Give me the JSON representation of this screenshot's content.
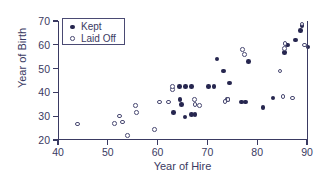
{
  "chart_data": {
    "type": "scatter",
    "title": "",
    "xlabel": "Year of Hire",
    "ylabel": "Year of Birth",
    "xlim": [
      40,
      90
    ],
    "ylim": [
      20,
      70
    ],
    "xticks": [
      40,
      50,
      60,
      70,
      80,
      90
    ],
    "yticks": [
      20,
      30,
      40,
      50,
      60,
      70
    ],
    "grid": false,
    "legend_position": "top-left",
    "series": [
      {
        "name": "Kept",
        "marker": "filled-circle",
        "color": "#26264f",
        "points": [
          [
            63.0,
            31.5
          ],
          [
            64.3,
            37.0
          ],
          [
            64.6,
            34.8
          ],
          [
            64.2,
            42.6
          ],
          [
            65.4,
            42.6
          ],
          [
            66.6,
            42.6
          ],
          [
            65.3,
            29.7
          ],
          [
            66.6,
            30.6
          ],
          [
            67.3,
            30.8
          ],
          [
            70.0,
            42.6
          ],
          [
            71.1,
            42.6
          ],
          [
            71.7,
            54.0
          ],
          [
            73.0,
            49.0
          ],
          [
            74.2,
            44.0
          ],
          [
            73.8,
            36.9
          ],
          [
            76.6,
            36.0
          ],
          [
            77.4,
            36.0
          ],
          [
            78.0,
            53.0
          ],
          [
            81.0,
            33.7
          ],
          [
            83.0,
            37.7
          ],
          [
            85.3,
            56.8
          ],
          [
            85.9,
            60.0
          ],
          [
            87.5,
            62.0
          ],
          [
            88.5,
            66.0
          ],
          [
            88.8,
            68.0
          ],
          [
            90.0,
            59.0
          ]
        ]
      },
      {
        "name": "Laid Off",
        "marker": "open-circle",
        "color": "#4a4a73",
        "points": [
          [
            43.7,
            26.8
          ],
          [
            51.2,
            26.9
          ],
          [
            52.2,
            30.0
          ],
          [
            52.7,
            27.6
          ],
          [
            53.8,
            21.8
          ],
          [
            55.4,
            34.6
          ],
          [
            55.6,
            31.5
          ],
          [
            59.2,
            24.5
          ],
          [
            60.2,
            36.0
          ],
          [
            62.0,
            36.0
          ],
          [
            62.8,
            41.2
          ],
          [
            62.8,
            42.6
          ],
          [
            67.2,
            36.9
          ],
          [
            67.3,
            34.8
          ],
          [
            68.2,
            34.6
          ],
          [
            73.3,
            36.2
          ],
          [
            73.9,
            37.0
          ],
          [
            76.8,
            58.0
          ],
          [
            77.3,
            56.0
          ],
          [
            84.4,
            49.0
          ],
          [
            85.0,
            38.4
          ],
          [
            85.3,
            58.5
          ],
          [
            85.4,
            60.5
          ],
          [
            86.9,
            37.7
          ],
          [
            88.8,
            68.8
          ],
          [
            89.3,
            60.0
          ]
        ]
      }
    ]
  },
  "axes": {
    "x_title": "Year of Hire",
    "y_title": "Year of Birth",
    "x_tick_labels": [
      "40",
      "50",
      "60",
      "70",
      "80",
      "90"
    ],
    "y_tick_labels": [
      "20",
      "30",
      "40",
      "50",
      "60",
      "70"
    ]
  },
  "legend": {
    "entries": [
      {
        "label": "Kept",
        "marker": "filled-circle"
      },
      {
        "label": "Laid Off",
        "marker": "open-circle"
      }
    ]
  },
  "colors": {
    "ink": "#3a3a62",
    "kept": "#26264f",
    "laid_off": "#4a4a73",
    "background": "#ffffff"
  }
}
